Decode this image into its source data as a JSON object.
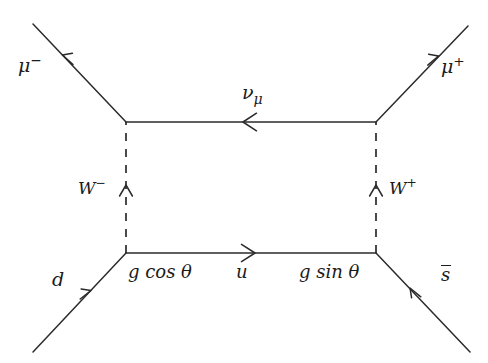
{
  "figure": {
    "kind": "feynman-diagram",
    "process": "d s-bar to mu-minus mu-plus via W boson exchange box",
    "background_color": "#ffffff",
    "line_color": "#2b2b2b"
  },
  "labels": {
    "muon_minus": "μ",
    "muon_minus_charge": "−",
    "muon_plus": "μ",
    "muon_plus_charge": "+",
    "neutrino": "ν",
    "neutrino_sub": "μ",
    "w_minus": "W",
    "w_minus_charge": "−",
    "w_plus": "W",
    "w_plus_charge": "+",
    "down_quark": "d",
    "up_quark": "u",
    "anti_strange_quark": "s",
    "coupling_left": "g cos θ",
    "coupling_right": "g sin θ"
  },
  "geometry": {
    "vertices": {
      "top_left": {
        "x": 126,
        "y": 122
      },
      "top_right": {
        "x": 376,
        "y": 122
      },
      "bottom_left": {
        "x": 126,
        "y": 253
      },
      "bottom_right": {
        "x": 376,
        "y": 253
      }
    },
    "external_legs": [
      {
        "name": "muon-minus-leg",
        "from": {
          "x": 33,
          "y": 24
        },
        "to": {
          "x": 126,
          "y": 122
        },
        "arrow": "toward-outside"
      },
      {
        "name": "muon-plus-leg",
        "from": {
          "x": 376,
          "y": 122
        },
        "to": {
          "x": 468,
          "y": 26
        },
        "arrow": "toward-outside"
      },
      {
        "name": "down-quark-leg",
        "from": {
          "x": 33,
          "y": 352
        },
        "to": {
          "x": 126,
          "y": 253
        },
        "arrow": "toward-vertex"
      },
      {
        "name": "anti-strange-leg",
        "from": {
          "x": 376,
          "y": 253
        },
        "to": {
          "x": 470,
          "y": 352
        },
        "arrow": "toward-vertex"
      }
    ],
    "internal_lines": [
      {
        "name": "neutrino-propagator",
        "style": "solid",
        "from": {
          "x": 126,
          "y": 122
        },
        "to": {
          "x": 376,
          "y": 122
        },
        "arrow_direction": "left"
      },
      {
        "name": "up-quark-propagator",
        "style": "solid",
        "from": {
          "x": 126,
          "y": 253
        },
        "to": {
          "x": 376,
          "y": 253
        },
        "arrow_direction": "right"
      },
      {
        "name": "w-minus-propagator",
        "style": "dashed",
        "from": {
          "x": 126,
          "y": 253
        },
        "to": {
          "x": 126,
          "y": 122
        },
        "arrow_direction": "up"
      },
      {
        "name": "w-plus-propagator",
        "style": "dashed",
        "from": {
          "x": 376,
          "y": 253
        },
        "to": {
          "x": 376,
          "y": 122
        },
        "arrow_direction": "up"
      }
    ]
  }
}
